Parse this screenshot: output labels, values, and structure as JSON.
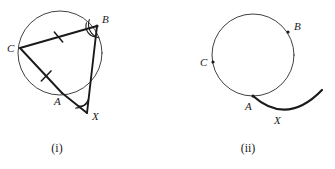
{
  "page": {
    "background_color": "#ffffff",
    "ink_color": "#1a1a1a",
    "thin_ink_color": "#2b2b2b",
    "width": 335,
    "height": 169
  },
  "figures": [
    {
      "id": "figure-i",
      "caption": "(i)",
      "caption_pos": {
        "x": 57,
        "y": 152
      },
      "circle": {
        "cx": 60,
        "cy": 53,
        "r": 42
      },
      "points": [
        {
          "name": "C",
          "x": 20,
          "y": 48,
          "label": "C",
          "label_x": 7,
          "label_y": 52,
          "dot": false
        },
        {
          "name": "B",
          "x": 97,
          "y": 26,
          "label": "B",
          "label_x": 102,
          "label_y": 23,
          "dot": true
        },
        {
          "name": "A",
          "x": 62,
          "y": 93,
          "label": "A",
          "label_x": 54,
          "label_y": 105,
          "dot": false
        },
        {
          "name": "X",
          "x": 87,
          "y": 113,
          "label": "X",
          "label_x": 92,
          "label_y": 120,
          "dot": false
        }
      ],
      "segments": [
        {
          "name": "chord-CB",
          "from": "C",
          "to": "B",
          "tick": true,
          "tick_t": 0.5
        },
        {
          "name": "chord-CA",
          "from": "C",
          "to": "A",
          "tick": true,
          "tick_t": 0.62
        },
        {
          "name": "segment-BX",
          "from": "B",
          "to": "X",
          "tick": false
        },
        {
          "name": "segment-AX",
          "from": "A",
          "to": "X",
          "tick": false
        }
      ],
      "angle_marks": [
        {
          "name": "angle-at-B",
          "vertex": "B",
          "radius": 11
        },
        {
          "name": "angle-at-X",
          "vertex": "X",
          "radius": 11
        }
      ]
    },
    {
      "id": "figure-ii",
      "caption": "(ii)",
      "caption_pos": {
        "x": 248,
        "y": 152
      },
      "circle": {
        "cx": 253,
        "cy": 55,
        "r": 41
      },
      "points": [
        {
          "name": "B",
          "x": 288,
          "y": 32,
          "label": "B",
          "label_x": 294,
          "label_y": 30,
          "dot": true
        },
        {
          "name": "C",
          "x": 213,
          "y": 62,
          "label": "C",
          "label_x": 200,
          "label_y": 66,
          "dot": true
        },
        {
          "name": "A",
          "x": 253,
          "y": 96,
          "label": "A",
          "label_x": 245,
          "label_y": 110,
          "dot": true
        },
        {
          "name": "X",
          "x": 280,
          "y": 112,
          "label": "X",
          "label_x": 274,
          "label_y": 124,
          "dot": false
        }
      ],
      "tangent_arc": {
        "name": "tangent-arc-through-A",
        "start_x": 253,
        "start_y": 96,
        "end_x": 322,
        "end_y": 90,
        "sweep_radius": 42,
        "description": "arc tangent to circle at A curving down-right past X"
      }
    }
  ]
}
